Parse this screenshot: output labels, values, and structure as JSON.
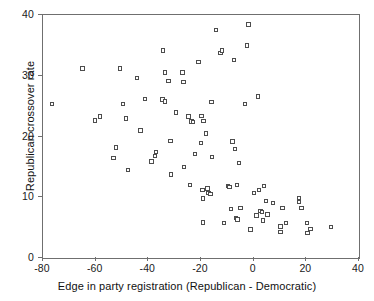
{
  "chart_data": {
    "type": "scatter",
    "title": "",
    "xlabel": "Edge in party registration (Republican - Democratic)",
    "ylabel": "Republican crossover rate",
    "xlim": [
      -80,
      40
    ],
    "ylim": [
      0,
      40
    ],
    "xticks": [
      -80,
      -60,
      -40,
      -20,
      0,
      20,
      40
    ],
    "xticklabels": [
      "-80",
      "-60",
      "-40",
      "-20",
      "0",
      "20",
      "40"
    ],
    "yticks": [
      0,
      10,
      20,
      30,
      40
    ],
    "yticklabels": [
      "0",
      "10",
      "20",
      "30",
      "40"
    ],
    "grid": false,
    "legend": null,
    "marker": "open-square",
    "marker_color": "#4d4d4d",
    "points": [
      [
        -76.2,
        25.2
      ],
      [
        -64.6,
        31.0
      ],
      [
        -59.8,
        22.5
      ],
      [
        -58.0,
        23.1
      ],
      [
        -52.0,
        18.0
      ],
      [
        -52.8,
        16.3
      ],
      [
        -50.4,
        31.0
      ],
      [
        -49.2,
        25.2
      ],
      [
        -48.0,
        22.8
      ],
      [
        -47.4,
        14.3
      ],
      [
        -44.0,
        29.5
      ],
      [
        -41.0,
        26.0
      ],
      [
        -42.6,
        20.8
      ],
      [
        -38.4,
        15.7
      ],
      [
        -37.2,
        16.6
      ],
      [
        -36.8,
        17.3
      ],
      [
        -34.0,
        34.0
      ],
      [
        -34.2,
        25.9
      ],
      [
        -33.2,
        25.6
      ],
      [
        -33.4,
        30.4
      ],
      [
        -32.0,
        29.0
      ],
      [
        -31.2,
        19.1
      ],
      [
        -31.0,
        13.6
      ],
      [
        -29.0,
        23.8
      ],
      [
        -26.6,
        30.4
      ],
      [
        -26.2,
        28.8
      ],
      [
        -26.0,
        14.8
      ],
      [
        -24.4,
        23.1
      ],
      [
        -23.8,
        11.9
      ],
      [
        -23.2,
        22.3
      ],
      [
        -22.6,
        22.2
      ],
      [
        -22.0,
        17.0
      ],
      [
        -20.6,
        32.1
      ],
      [
        -19.6,
        18.8
      ],
      [
        -19.4,
        23.2
      ],
      [
        -19.0,
        11.0
      ],
      [
        -18.8,
        9.6
      ],
      [
        -18.6,
        22.4
      ],
      [
        -18.8,
        5.7
      ],
      [
        -17.8,
        20.3
      ],
      [
        -17.2,
        11.3
      ],
      [
        -16.8,
        10.5
      ],
      [
        -16.0,
        10.4
      ],
      [
        -15.6,
        25.5
      ],
      [
        -15.4,
        16.5
      ],
      [
        -14.0,
        37.4
      ],
      [
        -12.2,
        33.6
      ],
      [
        -11.6,
        34.0
      ],
      [
        -11.0,
        5.6
      ],
      [
        -9.4,
        11.7
      ],
      [
        -8.8,
        11.5
      ],
      [
        -8.2,
        7.9
      ],
      [
        -7.6,
        19.0
      ],
      [
        -7.0,
        32.4
      ],
      [
        -6.8,
        17.8
      ],
      [
        -6.4,
        6.4
      ],
      [
        -6.0,
        11.9
      ],
      [
        -5.8,
        6.2
      ],
      [
        -5.2,
        15.5
      ],
      [
        -4.6,
        8.1
      ],
      [
        -3.0,
        25.2
      ],
      [
        -2.2,
        34.8
      ],
      [
        -1.6,
        38.3
      ],
      [
        -0.8,
        4.5
      ],
      [
        0.6,
        10.5
      ],
      [
        1.4,
        6.8
      ],
      [
        2.0,
        26.4
      ],
      [
        2.4,
        11.0
      ],
      [
        3.0,
        7.6
      ],
      [
        3.6,
        7.4
      ],
      [
        4.0,
        6.0
      ],
      [
        4.4,
        11.7
      ],
      [
        5.0,
        9.2
      ],
      [
        5.6,
        7.0
      ],
      [
        7.8,
        8.9
      ],
      [
        10.6,
        5.0
      ],
      [
        10.6,
        4.1
      ],
      [
        11.4,
        8.1
      ],
      [
        12.6,
        5.6
      ],
      [
        17.6,
        9.7
      ],
      [
        17.6,
        9.1
      ],
      [
        18.6,
        8.1
      ],
      [
        20.6,
        5.6
      ],
      [
        20.8,
        4.0
      ],
      [
        22.0,
        4.6
      ],
      [
        29.8,
        4.9
      ]
    ]
  }
}
